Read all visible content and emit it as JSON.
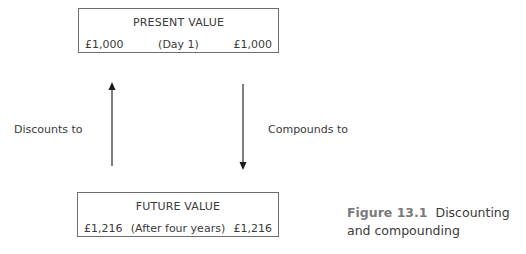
{
  "diagram": {
    "present_box": {
      "title": "PRESENT VALUE",
      "left_value": "£1,000",
      "middle_label": "(Day 1)",
      "right_value": "£1,000"
    },
    "future_box": {
      "title": "FUTURE VALUE",
      "left_value": "£1,216",
      "middle_label": "(After four years)",
      "right_value": "£1,216"
    },
    "left_arrow": {
      "direction": "up",
      "label": "Discounts to"
    },
    "right_arrow": {
      "direction": "down",
      "label": "Compounds to"
    }
  },
  "caption": {
    "figure_number": "Figure 13.1",
    "text": "Discounting and compounding"
  }
}
